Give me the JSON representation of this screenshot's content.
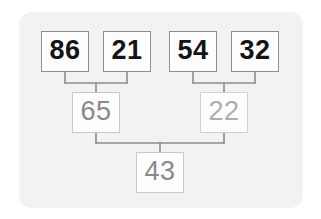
{
  "diagram": {
    "type": "binary-merge-tree",
    "title": "",
    "card_color": "#f2f2f2",
    "background_color": "#ffffff",
    "connector_color": "#8c8c8c",
    "leaf_text_color": "#141414",
    "inner_text_color": "#8a8a8a",
    "faint_text_color": "#adadad",
    "levels": [
      {
        "level": 1,
        "name": "leaves",
        "nodes": [
          {
            "id": "n-86",
            "value": "86",
            "style": "leaf"
          },
          {
            "id": "n-21",
            "value": "21",
            "style": "leaf"
          },
          {
            "id": "n-54",
            "value": "54",
            "style": "leaf"
          },
          {
            "id": "n-32",
            "value": "32",
            "style": "leaf"
          }
        ]
      },
      {
        "level": 2,
        "name": "intermediate",
        "nodes": [
          {
            "id": "n-65",
            "value": "65",
            "style": "inner"
          },
          {
            "id": "n-22",
            "value": "22",
            "style": "inner-faint"
          }
        ]
      },
      {
        "level": 3,
        "name": "root",
        "nodes": [
          {
            "id": "n-43",
            "value": "43",
            "style": "inner"
          }
        ]
      }
    ],
    "edges": [
      {
        "from": "n-86",
        "to": "n-65"
      },
      {
        "from": "n-21",
        "to": "n-65"
      },
      {
        "from": "n-54",
        "to": "n-22"
      },
      {
        "from": "n-32",
        "to": "n-22"
      },
      {
        "from": "n-65",
        "to": "n-43"
      },
      {
        "from": "n-22",
        "to": "n-43"
      }
    ]
  }
}
